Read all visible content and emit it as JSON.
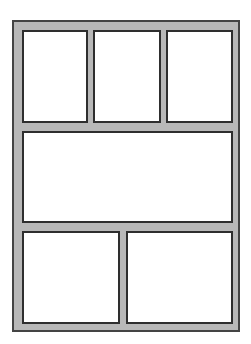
{
  "layout": {
    "type": "comic-page-template",
    "colors": {
      "frame_fill": "#b8b8b8",
      "frame_border": "#444444",
      "panel_fill": "#ffffff",
      "panel_border": "#2e2e2e"
    },
    "rows": [
      {
        "row": 1,
        "panels": 3
      },
      {
        "row": 2,
        "panels": 1
      },
      {
        "row": 3,
        "panels": 2
      }
    ],
    "panels": [
      {
        "id": "panel-1",
        "row": 1,
        "x": 22,
        "y": 30,
        "w": 66,
        "h": 93
      },
      {
        "id": "panel-2",
        "row": 1,
        "x": 93,
        "y": 30,
        "w": 68,
        "h": 93
      },
      {
        "id": "panel-3",
        "row": 1,
        "x": 166,
        "y": 30,
        "w": 67,
        "h": 93
      },
      {
        "id": "panel-4",
        "row": 2,
        "x": 22,
        "y": 131,
        "w": 211,
        "h": 92
      },
      {
        "id": "panel-5",
        "row": 3,
        "x": 22,
        "y": 231,
        "w": 98,
        "h": 93
      },
      {
        "id": "panel-6",
        "row": 3,
        "x": 126,
        "y": 231,
        "w": 107,
        "h": 93
      }
    ]
  }
}
